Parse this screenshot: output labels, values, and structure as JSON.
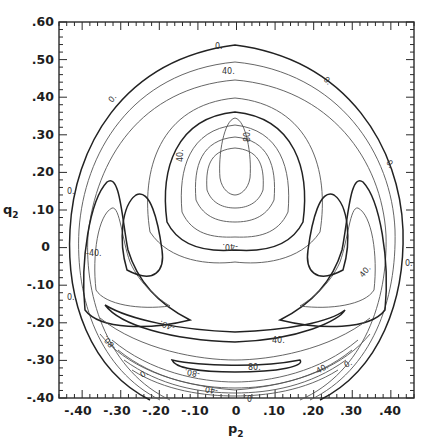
{
  "chart_data": {
    "type": "contour",
    "title": "",
    "xlabel": "p2",
    "ylabel": "q2",
    "xlim": [
      -0.46,
      0.46
    ],
    "ylim": [
      -0.4,
      0.6
    ],
    "x_ticks": [
      "-.40",
      "-.30",
      "-.20",
      "-.10",
      "0",
      ".10",
      ".20",
      ".30",
      ".40"
    ],
    "y_ticks": [
      ".60",
      ".50",
      ".40",
      ".30",
      ".20",
      ".10",
      "0",
      "-.10",
      "-.20",
      "-.30",
      "-.40"
    ],
    "grid": false,
    "legend": null,
    "contour_labels": [
      {
        "text": "0.",
        "x": 0.02,
        "y": 0.52
      },
      {
        "text": "40.",
        "x": 0.05,
        "y": 0.45
      },
      {
        "text": "0.",
        "x": -0.33,
        "y": 0.36
      },
      {
        "text": "0.",
        "x": 0.3,
        "y": 0.41
      },
      {
        "text": "80.",
        "x": 0.07,
        "y": 0.29
      },
      {
        "text": "40.",
        "x": -0.12,
        "y": 0.23
      },
      {
        "text": "0.",
        "x": -0.41,
        "y": 0.13
      },
      {
        "text": "0.",
        "x": 0.37,
        "y": 0.17
      },
      {
        "text": "-40.",
        "x": -0.38,
        "y": -0.01
      },
      {
        "text": "-40.",
        "x": 0.0,
        "y": 0.0
      },
      {
        "text": "0.",
        "x": -0.41,
        "y": -0.14
      },
      {
        "text": "0.",
        "x": 0.42,
        "y": -0.09
      },
      {
        "text": "40.",
        "x": 0.36,
        "y": -0.13
      },
      {
        "text": "-40.",
        "x": -0.16,
        "y": -0.21
      },
      {
        "text": "40.",
        "x": 0.14,
        "y": -0.21
      },
      {
        "text": "-80.",
        "x": -0.32,
        "y": -0.27
      },
      {
        "text": "-80.",
        "x": -0.06,
        "y": -0.3
      },
      {
        "text": "80.",
        "x": 0.05,
        "y": -0.3
      },
      {
        "text": "40.",
        "x": 0.2,
        "y": -0.31
      },
      {
        "text": "0.",
        "x": 0.27,
        "y": -0.28
      },
      {
        "text": "0.",
        "x": -0.23,
        "y": -0.34
      },
      {
        "text": "-40.",
        "x": -0.08,
        "y": -0.37
      },
      {
        "text": "0.",
        "x": 0.03,
        "y": -0.39
      }
    ],
    "features": {
      "central_peak": {
        "label": "80.",
        "center": [
          0.0,
          0.28
        ]
      },
      "side_lobes": [
        {
          "side": "left",
          "center": [
            -0.28,
            -0.02
          ],
          "label": "-40."
        },
        {
          "side": "right",
          "center": [
            0.28,
            -0.02
          ],
          "label": "40."
        }
      ],
      "bottom_lobe": {
        "center": [
          0.0,
          -0.3
        ],
        "labels": [
          "-80.",
          "80."
        ]
      },
      "outer_boundary_value": "0."
    }
  }
}
